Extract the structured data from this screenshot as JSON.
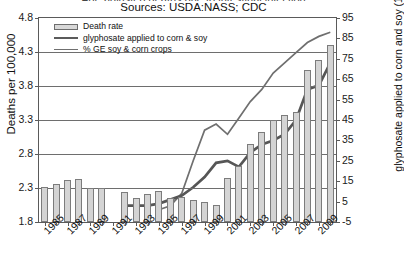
{
  "title_clipped": "Age adjusted deaths due to intestinal infection",
  "sources": "Sources: USDA:NASS; CDC",
  "legend": [
    {
      "key": "death-rate",
      "label": "Death rate",
      "style": "bar",
      "color": "#d4d4d4"
    },
    {
      "key": "glyphosate",
      "label": "glyphosate applied to corn & soy",
      "style": "line-thick",
      "color": "#5b5b5b"
    },
    {
      "key": "ge-crops",
      "label": "% GE soy & corn crops",
      "style": "line-thin",
      "color": "#6f6f6f"
    }
  ],
  "axes": {
    "left_title": "Deaths per 100,000",
    "right_title": "glyphosate applied to corn and soy (1,000 tons)",
    "left_ticks": [
      "4.8",
      "4.3",
      "3.8",
      "3.3",
      "2.8",
      "2.3",
      "1.8"
    ],
    "right_ticks": [
      "95",
      "85",
      "75",
      "65",
      "55",
      "45",
      "35",
      "25",
      "15",
      "5",
      "-5"
    ],
    "x_ticks": [
      "1985",
      "1987",
      "1989",
      "1991",
      "1993",
      "1995",
      "1997",
      "1999",
      "2001",
      "2003",
      "2005",
      "2007",
      "2009"
    ]
  },
  "chart_data": {
    "type": "bar",
    "title": "Age adjusted deaths due to intestinal infection",
    "subtitle": "Sources: USDA:NASS; CDC",
    "xlabel": "",
    "ylabel": "Deaths per 100,000",
    "ylabel_right": "glyphosate applied to corn and soy (1,000 tons)",
    "ylim": [
      1.8,
      4.8
    ],
    "ylim_right": [
      -5,
      95
    ],
    "grid": true,
    "legend_position": "top-left",
    "x": [
      1985,
      1986,
      1987,
      1988,
      1989,
      1990,
      1991,
      1992,
      1993,
      1994,
      1995,
      1996,
      1997,
      1998,
      1999,
      2000,
      2001,
      2002,
      2003,
      2004,
      2005,
      2006,
      2007,
      2008,
      2009,
      2010
    ],
    "series": [
      {
        "name": "Death rate",
        "type": "bar",
        "axis": "left",
        "unit": "deaths per 100,000",
        "values": [
          2.32,
          2.36,
          2.42,
          2.43,
          2.3,
          2.3,
          null,
          2.24,
          2.16,
          2.21,
          2.26,
          2.15,
          2.17,
          2.12,
          2.09,
          2.05,
          2.45,
          2.63,
          2.95,
          3.13,
          3.3,
          3.38,
          3.42,
          4.03,
          4.19,
          4.41
        ]
      },
      {
        "name": "glyphosate applied to corn & soy",
        "type": "line",
        "axis": "right",
        "unit": "1,000 tons",
        "values": [
          null,
          null,
          null,
          null,
          null,
          null,
          null,
          3,
          3,
          3,
          4,
          6,
          8,
          12,
          17,
          24,
          25,
          22,
          29,
          33,
          35,
          38,
          45,
          60,
          62,
          73
        ]
      },
      {
        "name": "% GE soy & corn crops",
        "type": "line",
        "axis": "right",
        "unit": "percent",
        "values": [
          null,
          null,
          null,
          null,
          null,
          null,
          null,
          null,
          null,
          null,
          1,
          3,
          9,
          25,
          40,
          43,
          38,
          46,
          54,
          60,
          68,
          73,
          78,
          83,
          86,
          88
        ]
      }
    ]
  }
}
